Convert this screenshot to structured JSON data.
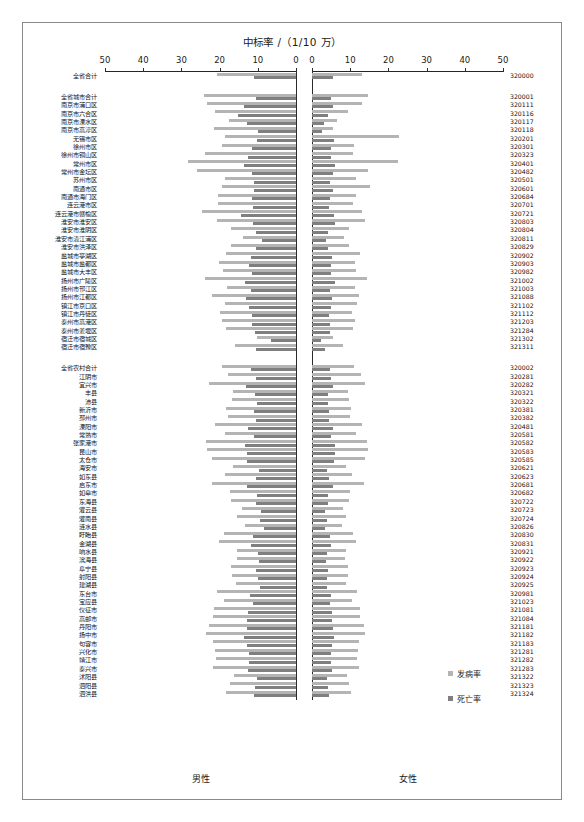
{
  "figure": {
    "title": "中标率 /（1/10 万）",
    "left_panel_label": "男性",
    "right_panel_label": "女性",
    "legend": [
      {
        "label": "发病率",
        "color": "#b4b4b4"
      },
      {
        "label": "死亡率",
        "color": "#7f7f7f"
      }
    ]
  },
  "chart_data": {
    "type": "bar",
    "title": "中标率 /（1/10 万）",
    "orientation": "horizontal-pyramid",
    "xlabel": "中标率 /（1/10 万）",
    "ylabel": "",
    "grid": false,
    "legend_position": "bottom-right",
    "axis": {
      "left_ticks": [
        50,
        40,
        30,
        20,
        10,
        0
      ],
      "right_ticks": [
        0,
        10,
        20,
        30,
        40,
        50
      ],
      "left_range": [
        50,
        0
      ],
      "right_range": [
        0,
        50
      ],
      "left_panel": "男性",
      "right_panel": "女性"
    },
    "series": [
      {
        "name": "发病率",
        "color": "#b4b4b4"
      },
      {
        "name": "死亡率",
        "color": "#7f7f7f"
      }
    ],
    "categories": [
      "全省合计",
      "全省城市合计",
      "南京市浦口区",
      "南京市六合区",
      "南京市溧水区",
      "南京市高淳区",
      "无锡市区",
      "徐州市区",
      "徐州市铜山区",
      "常州市区",
      "常州市金坛区",
      "苏州市区",
      "南通市区",
      "南通市海门区",
      "连云港市区",
      "连云港市赣榆区",
      "淮安市淮安区",
      "淮安市淮阴区",
      "淮安市清江浦区",
      "淮安市洪泽区",
      "盐城市亭湖区",
      "盐城市盐都区",
      "盐城市大丰区",
      "扬州市广陵区",
      "扬州市邗江区",
      "扬州市江都区",
      "镇江市京口区",
      "镇江市丹徒区",
      "泰州市高港区",
      "泰州市姜堰区",
      "宿迁市宿城区",
      "宿迁市宿豫区",
      "全省农村合计",
      "江阴市",
      "宜兴市",
      "丰县",
      "沛县",
      "新沂市",
      "邳州市",
      "溧阳市",
      "常熟市",
      "张家港市",
      "昆山市",
      "太仓市",
      "海安市",
      "如东县",
      "启东市",
      "如皋市",
      "东海县",
      "灌云县",
      "灌南县",
      "涟水县",
      "盱眙县",
      "金湖县",
      "响水县",
      "滨海县",
      "阜宁县",
      "射阳县",
      "建湖县",
      "东台市",
      "宝应县",
      "仪征市",
      "高邮市",
      "丹阳市",
      "扬中市",
      "句容市",
      "兴化市",
      "靖江市",
      "泰兴市",
      "沭阳县",
      "泗阳县",
      "泗洪县"
    ],
    "codes": [
      "320000",
      "320001",
      "320111",
      "320116",
      "320117",
      "320118",
      "320201",
      "320301",
      "320323",
      "320401",
      "320482",
      "320501",
      "320601",
      "320684",
      "320701",
      "320721",
      "320803",
      "320804",
      "320811",
      "320829",
      "320902",
      "320903",
      "320982",
      "321002",
      "321003",
      "321088",
      "321102",
      "321112",
      "321203",
      "321284",
      "321302",
      "321311",
      "320002",
      "320281",
      "320282",
      "320321",
      "320322",
      "320381",
      "320382",
      "320481",
      "320581",
      "320582",
      "320583",
      "320585",
      "320621",
      "320623",
      "320681",
      "320682",
      "320722",
      "320723",
      "320724",
      "320826",
      "320830",
      "320831",
      "320921",
      "320922",
      "320923",
      "320924",
      "320925",
      "320981",
      "321023",
      "321081",
      "321084",
      "321181",
      "321182",
      "321183",
      "321281",
      "321282",
      "321283",
      "321322",
      "321323",
      "321324"
    ],
    "data": {
      "male_incidence": [
        20.6,
        24.0,
        23.4,
        21.2,
        17.6,
        21.5,
        18.6,
        19.3,
        23.9,
        28.3,
        26.0,
        18.6,
        19.5,
        20.5,
        20.5,
        24.7,
        20.8,
        17.0,
        14.0,
        17.0,
        18.3,
        20.1,
        19.0,
        23.8,
        18.1,
        22.0,
        18.7,
        19.8,
        19.5,
        18.3,
        10.2,
        16.0,
        19.5,
        17.8,
        22.7,
        16.6,
        16.8,
        18.2,
        17.7,
        21.2,
        18.7,
        23.5,
        23.2,
        21.9,
        16.5,
        18.5,
        22.1,
        17.2,
        17.1,
        14.1,
        15.4,
        13.3,
        18.9,
        20.2,
        15.5,
        15.4,
        17.0,
        16.8,
        15.6,
        20.6,
        18.9,
        21.5,
        21.8,
        22.9,
        23.6,
        21.8,
        21.2,
        21.0,
        21.8,
        16.2,
        17.3,
        18.4
      ],
      "male_mortality": [
        11.0,
        10.5,
        13.7,
        15.3,
        12.7,
        10.0,
        10.1,
        11.5,
        12.5,
        13.7,
        11.4,
        11.1,
        11.0,
        11.4,
        11.2,
        14.4,
        11.3,
        10.5,
        8.9,
        10.4,
        11.9,
        12.4,
        11.5,
        13.3,
        11.7,
        13.0,
        12.2,
        11.5,
        11.5,
        10.7,
        6.5,
        10.4,
        11.8,
        10.5,
        13.2,
        10.8,
        10.1,
        11.0,
        10.4,
        12.5,
        10.9,
        13.4,
        12.8,
        12.8,
        9.7,
        10.6,
        12.9,
        10.2,
        10.5,
        9.2,
        9.5,
        8.4,
        11.3,
        11.9,
        9.9,
        9.6,
        10.4,
        10.0,
        9.5,
        12.1,
        11.3,
        12.5,
        12.7,
        12.9,
        13.7,
        12.7,
        12.3,
        12.4,
        12.6,
        10.2,
        10.7,
        11.0
      ],
      "female_incidence": [
        13.0,
        14.6,
        13.2,
        9.5,
        6.5,
        5.6,
        22.9,
        11.1,
        10.8,
        22.4,
        14.6,
        11.5,
        15.1,
        11.5,
        10.8,
        13.0,
        14.0,
        9.6,
        8.3,
        9.8,
        12.6,
        11.3,
        11.4,
        14.5,
        11.2,
        12.4,
        11.9,
        10.5,
        11.2,
        10.8,
        5.6,
        8.1,
        11.0,
        12.7,
        13.9,
        9.4,
        9.7,
        10.3,
        10.0,
        13.1,
        11.6,
        14.4,
        14.7,
        14.0,
        9.0,
        10.4,
        13.6,
        9.9,
        9.8,
        8.2,
        8.9,
        7.8,
        10.8,
        11.6,
        8.8,
        8.6,
        9.5,
        9.3,
        8.8,
        11.9,
        10.6,
        12.6,
        12.5,
        13.5,
        14.0,
        12.4,
        12.1,
        11.8,
        12.4,
        9.1,
        9.8,
        10.3
      ],
      "female_mortality": [
        5.6,
        5.0,
        5.5,
        4.3,
        3.2,
        2.6,
        5.8,
        4.9,
        5.1,
        6.0,
        5.5,
        4.7,
        5.6,
        4.8,
        4.5,
        5.8,
        5.9,
        4.2,
        3.6,
        4.2,
        5.2,
        4.9,
        4.9,
        6.0,
        4.8,
        5.3,
        5.0,
        4.5,
        4.8,
        4.6,
        2.4,
        3.5,
        4.8,
        5.1,
        5.6,
        4.1,
        4.2,
        4.5,
        4.4,
        5.4,
        4.9,
        5.9,
        6.0,
        5.7,
        3.9,
        4.5,
        5.5,
        4.3,
        4.2,
        3.5,
        3.8,
        3.4,
        4.6,
        4.9,
        3.8,
        3.7,
        4.1,
        4.0,
        3.8,
        5.0,
        4.6,
        5.2,
        5.2,
        5.5,
        5.8,
        5.2,
        5.0,
        4.9,
        5.2,
        3.9,
        4.2,
        4.4
      ]
    }
  }
}
